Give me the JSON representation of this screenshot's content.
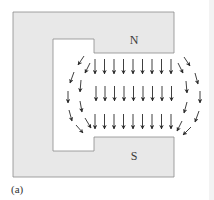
{
  "figure": {
    "caption": "(a)",
    "magnet": {
      "type": "horseshoe",
      "fill_color": "#e8e8e8",
      "stroke_color": "#8a8a8a",
      "north_label": "N",
      "south_label": "S"
    },
    "field": {
      "direction": "north-to-south (downward)",
      "arrow_color": "#2a2a2a",
      "rows_of_straight_arrows": 3,
      "straight_arrows_per_row": 9
    }
  }
}
